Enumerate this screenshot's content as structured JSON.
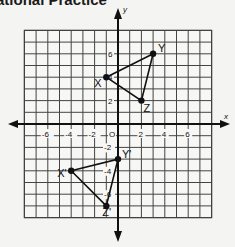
{
  "header": {
    "title": "ational Practice"
  },
  "chart_data": {
    "type": "scatter",
    "title": "",
    "xlabel": "x",
    "ylabel": "y",
    "xlim": [
      -8,
      8
    ],
    "ylim": [
      -8,
      8
    ],
    "grid": true,
    "x_tick_labels": [
      "-6",
      "-4",
      "-2",
      "O",
      "2",
      "4",
      "6"
    ],
    "y_tick_labels": [
      "6",
      "4",
      "2",
      "-2",
      "-4",
      "-6"
    ],
    "series": [
      {
        "name": "Triangle XYZ",
        "points": [
          {
            "label": "X",
            "x": -1,
            "y": 4
          },
          {
            "label": "Y",
            "x": 3,
            "y": 6
          },
          {
            "label": "Z",
            "x": 2,
            "y": 2
          }
        ]
      },
      {
        "name": "Triangle X'Y'Z'",
        "points": [
          {
            "label": "X'",
            "x": -4,
            "y": -4
          },
          {
            "label": "Y'",
            "x": 0,
            "y": -3
          },
          {
            "label": "Z'",
            "x": -1,
            "y": -7
          }
        ]
      }
    ]
  }
}
